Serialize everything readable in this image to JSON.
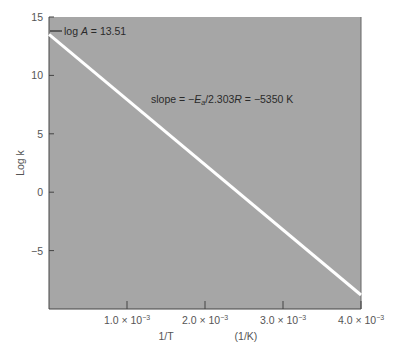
{
  "chart_data": {
    "type": "line",
    "title": "",
    "xlabel": "1/T",
    "xlabel_unit": "(1/K)",
    "ylabel": "Log k",
    "xlim": [
      0,
      0.004
    ],
    "ylim": [
      -10,
      15
    ],
    "x_ticks": [
      {
        "value": 0.001,
        "label": "1.0 × 10",
        "exp": "−3"
      },
      {
        "value": 0.002,
        "label": "2.0 × 10",
        "exp": "−3"
      },
      {
        "value": 0.003,
        "label": "3.0 × 10",
        "exp": "−3"
      },
      {
        "value": 0.004,
        "label": "4.0 × 10",
        "exp": "−3"
      }
    ],
    "y_ticks": [
      {
        "value": 15,
        "label": "15"
      },
      {
        "value": 10,
        "label": "10"
      },
      {
        "value": 5,
        "label": "5"
      },
      {
        "value": 0,
        "label": "0"
      },
      {
        "value": -5,
        "label": "−5"
      }
    ],
    "series": [
      {
        "name": "log k vs 1/T",
        "x": [
          0,
          0.004
        ],
        "y": [
          13.51,
          -8.8
        ],
        "color": "#ffffff"
      }
    ],
    "annotations": [
      {
        "text_prefix": "log ",
        "var": "A",
        "text_suffix": " = 13.51"
      },
      {
        "text_prefix": "slope = −",
        "var": "E",
        "sub": "a",
        "text_mid": "/2.303",
        "var2": "R",
        "text_suffix": " = −5350 K"
      }
    ],
    "grid": false,
    "plot_background": "#a6a6a6"
  }
}
